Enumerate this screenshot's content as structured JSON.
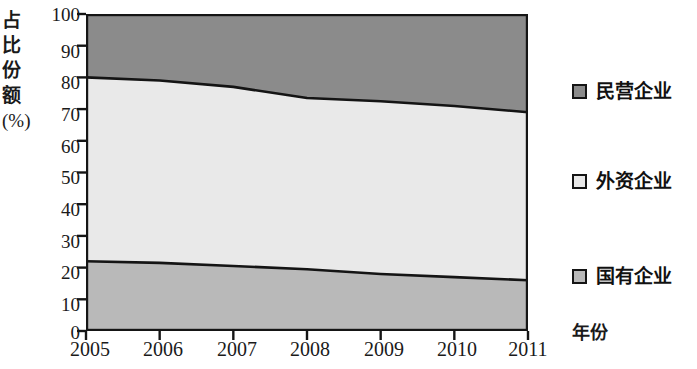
{
  "chart_data": {
    "type": "area",
    "title": "",
    "subtitle": "",
    "xlabel": "年份",
    "ylabel": "占比份额(%)",
    "ylabel_chars": [
      "占",
      "比",
      "份",
      "额"
    ],
    "ylabel_unit": "(%)",
    "stacked": true,
    "grid": false,
    "legend_position": "right",
    "x": [
      "2005",
      "2006",
      "2007",
      "2008",
      "2009",
      "2010",
      "2011"
    ],
    "categories": [
      "2005",
      "2006",
      "2007",
      "2008",
      "2009",
      "2010",
      "2011"
    ],
    "xlim": [
      2005,
      2011
    ],
    "ylim": [
      0,
      100
    ],
    "ytick_labels": [
      "0",
      "10",
      "20",
      "30",
      "40",
      "50",
      "60",
      "70",
      "80",
      "90",
      "100"
    ],
    "ytick_values": [
      0,
      10,
      20,
      30,
      40,
      50,
      60,
      70,
      80,
      90,
      100
    ],
    "xtick_labels": [
      "2005",
      "2006",
      "2007",
      "2008",
      "2009",
      "2010",
      "2011"
    ],
    "series": [
      {
        "name": "国有企业",
        "color": "#b9b9b9",
        "values": [
          22,
          21.5,
          20.5,
          19.5,
          18,
          17,
          16
        ],
        "cumulative_top": [
          22,
          21.5,
          20.5,
          19.5,
          18,
          17,
          16
        ]
      },
      {
        "name": "外资企业",
        "color": "#e9e9e9",
        "values": [
          58,
          57.5,
          56.5,
          54,
          54.5,
          54,
          53
        ],
        "cumulative_top": [
          80,
          79,
          77,
          73.5,
          72.5,
          71,
          69
        ]
      },
      {
        "name": "民营企业",
        "color": "#8b8b8b",
        "values": [
          20,
          21,
          23,
          26.5,
          27.5,
          29,
          31
        ],
        "cumulative_top": [
          100,
          100,
          100,
          100,
          100,
          100,
          100
        ]
      }
    ],
    "legend": [
      {
        "label": "民营企业",
        "color": "#8b8b8b"
      },
      {
        "label": "外资企业",
        "color": "#e9e9e9"
      },
      {
        "label": "国有企业",
        "color": "#b9b9b9"
      }
    ]
  },
  "colors": {
    "axis": "#151515",
    "line": "#141414",
    "background": "#ffffff",
    "band_top": "#8b8b8b",
    "band_middle": "#e9e9e9",
    "band_bottom": "#b9b9b9"
  }
}
